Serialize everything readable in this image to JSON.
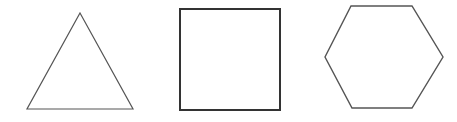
{
  "canvas": {
    "width": 457,
    "height": 122,
    "background_color": "#ffffff",
    "description": "Three hollow outline geometric shapes in a row on a plain white background"
  },
  "shapes": [
    {
      "name": "triangle",
      "label": "triangle",
      "sides": 3,
      "orientation": "point-up equilateral",
      "stroke_color": "#555555",
      "stroke_width": 1.2,
      "fill": "none",
      "points": "80,13 133,109 27,109",
      "bbox": {
        "x": 27,
        "y": 13,
        "width": 106,
        "height": 96
      }
    },
    {
      "name": "square",
      "label": "square",
      "sides": 4,
      "orientation": "axis-aligned",
      "stroke_color": "#333333",
      "stroke_width": 2,
      "fill": "none",
      "points": "180,9 280,9 280,110 180,110",
      "bbox": {
        "x": 180,
        "y": 9,
        "width": 100,
        "height": 101
      }
    },
    {
      "name": "hexagon",
      "label": "hexagon",
      "sides": 6,
      "orientation": "flat-top",
      "stroke_color": "#555555",
      "stroke_width": 1.4,
      "fill": "none",
      "points": "351,6 412,6 443,57 412,108 352,108 325,57",
      "bbox": {
        "x": 325,
        "y": 6,
        "width": 118,
        "height": 102
      }
    }
  ]
}
